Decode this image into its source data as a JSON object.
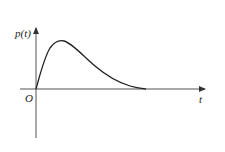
{
  "diagram": {
    "y_axis_label": "p(t)",
    "x_axis_label": "t",
    "origin_label": "O",
    "curve_description": "Right-skewed pulse starting at origin, peaking early, decaying to zero",
    "colors": {
      "axis": "#555555",
      "curve": "#222222",
      "background": "#ffffff"
    }
  }
}
